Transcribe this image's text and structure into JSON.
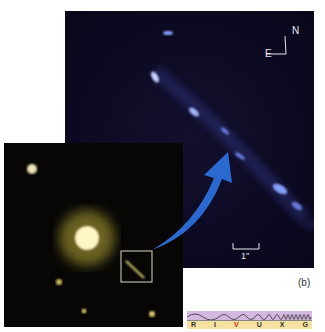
{
  "figure": {
    "panel_label": "(b)",
    "compass": {
      "north": "N",
      "east": "E"
    },
    "scale_bar": "1\"",
    "spectrum": {
      "bands": [
        "R",
        "I",
        "V",
        "U",
        "X",
        "G"
      ],
      "active_band": "V",
      "colors": {
        "wave_bg": "#d4b8e2",
        "label_bg": "#f5e1a0",
        "active": "#d8281a"
      }
    },
    "colors": {
      "arrow": "#2a6ad0",
      "inset_box": "#d8d8c8",
      "jet": "#8aa0ff",
      "quasar": "#fff6c8"
    }
  }
}
